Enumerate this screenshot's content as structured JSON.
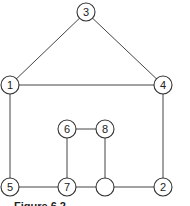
{
  "diagram": {
    "type": "graph",
    "nodes": [
      {
        "id": "n3",
        "label": "3",
        "x": 86,
        "y": 12
      },
      {
        "id": "n1",
        "label": "1",
        "x": 10,
        "y": 85
      },
      {
        "id": "n4",
        "label": "4",
        "x": 163,
        "y": 85
      },
      {
        "id": "n6",
        "label": "6",
        "x": 67,
        "y": 129
      },
      {
        "id": "n8",
        "label": "8",
        "x": 105,
        "y": 129
      },
      {
        "id": "n5",
        "label": "5",
        "x": 10,
        "y": 187
      },
      {
        "id": "n7",
        "label": "7",
        "x": 67,
        "y": 187
      },
      {
        "id": "n9",
        "label": "",
        "x": 105,
        "y": 187
      },
      {
        "id": "n2",
        "label": "2",
        "x": 163,
        "y": 187
      }
    ],
    "edges": [
      [
        "n3",
        "n1"
      ],
      [
        "n3",
        "n4"
      ],
      [
        "n1",
        "n4"
      ],
      [
        "n1",
        "n5"
      ],
      [
        "n4",
        "n2"
      ],
      [
        "n5",
        "n7"
      ],
      [
        "n7",
        "n9"
      ],
      [
        "n9",
        "n2"
      ],
      [
        "n6",
        "n8"
      ],
      [
        "n6",
        "n7"
      ],
      [
        "n8",
        "n9"
      ]
    ]
  },
  "caption": "Figure 6.2"
}
